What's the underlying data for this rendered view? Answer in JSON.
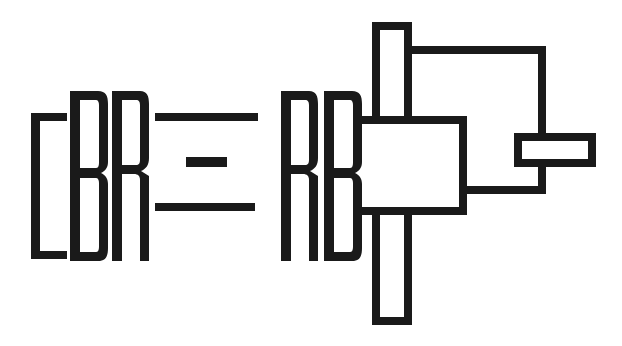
{
  "artwork": {
    "kind": "logo-mark",
    "title": "[BR = RB] mark",
    "alt_text": "[BR = RB]",
    "background_color": "#ffffff",
    "ink_color": "#1a1a1a",
    "stroke_width_px": 8,
    "canvas": {
      "width": 622,
      "height": 346
    }
  },
  "wordmark": {
    "full_text": "[BR = RB]",
    "glyphs": [
      {
        "name": "left-bracket",
        "char": "[",
        "x": 31,
        "y": 113,
        "width": 36,
        "height": 146
      },
      {
        "name": "letter-b-left",
        "char": "B",
        "x": 70,
        "y": 91,
        "width": 38,
        "height": 170
      },
      {
        "name": "letter-r-left",
        "char": "R",
        "x": 112,
        "y": 91,
        "width": 36,
        "height": 170
      },
      {
        "name": "equals-sign",
        "char": "=",
        "x": 155,
        "y": 113,
        "width": 103,
        "height": 98
      },
      {
        "name": "letter-r-right",
        "char": "R",
        "x": 281,
        "y": 91,
        "width": 36,
        "height": 170
      },
      {
        "name": "letter-b-right",
        "char": "B",
        "x": 324,
        "y": 91,
        "width": 38,
        "height": 170
      },
      {
        "name": "right-bracket-abstract",
        "char": "]",
        "x": 358,
        "y": 18,
        "width": 242,
        "height": 311
      }
    ]
  },
  "equals_bars": [
    {
      "name": "equals-top-bar",
      "x": 155,
      "y": 113,
      "width": 103,
      "height": 8
    },
    {
      "name": "equals-middle-dash",
      "x": 186,
      "y": 157,
      "width": 41,
      "height": 10
    },
    {
      "name": "equals-bottom-bar",
      "x": 155,
      "y": 203,
      "width": 100,
      "height": 8
    }
  ],
  "right_mark": {
    "name": "abstract-bracket-assembly",
    "parts": [
      {
        "name": "top-stem-rectangle",
        "x": 372,
        "y": 22,
        "width": 40,
        "height": 98
      },
      {
        "name": "upper-shelf-path",
        "description": "horizontal arm running right from top stem then turning down"
      },
      {
        "name": "center-body-rectangle",
        "x": 360,
        "y": 120,
        "width": 107,
        "height": 95
      },
      {
        "name": "right-cross-bar-rectangle",
        "x": 514,
        "y": 133,
        "width": 82,
        "height": 34
      },
      {
        "name": "lower-return-path",
        "description": "horizontal arm running right from center body to the cross bar stem"
      },
      {
        "name": "bottom-stem-rectangle",
        "x": 372,
        "y": 215,
        "width": 40,
        "height": 110
      }
    ]
  }
}
